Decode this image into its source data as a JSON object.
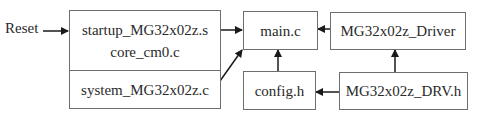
{
  "diagram": {
    "input_label": "Reset",
    "nodes": {
      "startup": {
        "lines": [
          "startup_MG32x02z.s",
          "core_cm0.c"
        ]
      },
      "system": {
        "label": "system_MG32x02z.c"
      },
      "main": {
        "label": "main.c"
      },
      "config": {
        "label": "config.h"
      },
      "driver": {
        "label": "MG32x02z_Driver"
      },
      "drv_h": {
        "label": "MG32x02z_DRV.h"
      }
    },
    "edges": [
      {
        "from": "Reset",
        "to": "startup"
      },
      {
        "from": "startup",
        "to": "main"
      },
      {
        "from": "system",
        "to": "main"
      },
      {
        "from": "config",
        "to": "main"
      },
      {
        "from": "driver",
        "to": "main"
      },
      {
        "from": "drv_h",
        "to": "driver"
      },
      {
        "from": "drv_h",
        "to": "config"
      }
    ]
  }
}
